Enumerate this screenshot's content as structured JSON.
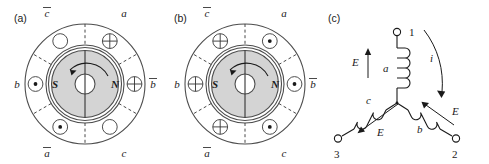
{
  "figure": {
    "caption_panels": [
      "(a)",
      "(b)",
      "(c)"
    ]
  },
  "panel_a": {
    "label": "(a)",
    "rotor": {
      "south_pole": "S",
      "north_pole": "N",
      "rotation": "counterclockwise"
    },
    "phase_labels": {
      "top_left": "c",
      "top_left_bar": true,
      "top_right": "a",
      "right": "b",
      "right_bar": true,
      "bottom_right": "c",
      "bottom_left": "a",
      "bottom_left_bar": true,
      "left": "b"
    },
    "slots": [
      {
        "position": "top-left",
        "symbol": "circle"
      },
      {
        "position": "top-right",
        "symbol": "cross"
      },
      {
        "position": "right",
        "symbol": "cross"
      },
      {
        "position": "bottom-right",
        "symbol": "circle"
      },
      {
        "position": "bottom-left",
        "symbol": "dot"
      },
      {
        "position": "left",
        "symbol": "dot"
      }
    ]
  },
  "panel_b": {
    "label": "(b)",
    "rotor": {
      "south_pole": "S",
      "north_pole": "N",
      "rotation": "counterclockwise"
    },
    "phase_labels": {
      "top_left": "c",
      "top_left_bar": true,
      "top_right": "a",
      "right": "b",
      "right_bar": true,
      "bottom_right": "c",
      "bottom_left": "a",
      "bottom_left_bar": true,
      "left": "b"
    },
    "slots": [
      {
        "position": "top-left",
        "symbol": "cross"
      },
      {
        "position": "top-right",
        "symbol": "dot"
      },
      {
        "position": "right",
        "symbol": "dot"
      },
      {
        "position": "bottom-right",
        "symbol": "dot"
      },
      {
        "position": "bottom-left",
        "symbol": "cross"
      },
      {
        "position": "left",
        "symbol": "cross"
      }
    ]
  },
  "panel_c": {
    "label": "(c)",
    "terminals": [
      {
        "id": "1",
        "label": "1"
      },
      {
        "id": "2",
        "label": "2"
      },
      {
        "id": "3",
        "label": "3"
      }
    ],
    "coils": [
      {
        "id": "a",
        "label": "a"
      },
      {
        "id": "b",
        "label": "b"
      },
      {
        "id": "c",
        "label": "c"
      }
    ],
    "emf_labels": [
      "E",
      "E",
      "E"
    ],
    "current_label": "i"
  },
  "colors": {
    "rotor_fill": "#d4d4d4",
    "outline": "#4d4d4d",
    "ink": "#1a1a1a",
    "background": "#ffffff"
  }
}
